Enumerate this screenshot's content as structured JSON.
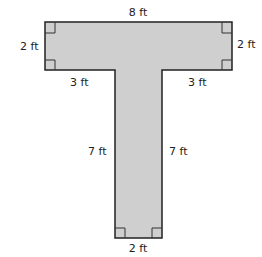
{
  "figure": {
    "shape": "T-shape",
    "fill_color": "#cfcfcf",
    "stroke_color": "#222222",
    "labels": {
      "top": "8 ft",
      "left_side": "2 ft",
      "right_side": "2 ft",
      "bottom_left_ledge": "3 ft",
      "bottom_right_ledge": "3 ft",
      "stem_left": "7 ft",
      "stem_right": "7 ft",
      "stem_bottom": "2 ft"
    }
  }
}
